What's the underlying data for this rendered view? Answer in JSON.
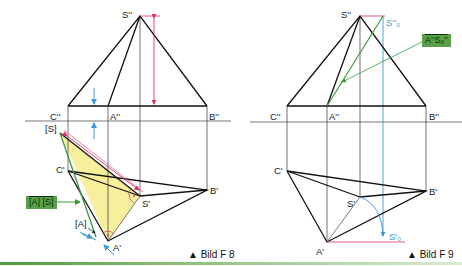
{
  "figures": [
    {
      "caption": "▲ Bild F 8",
      "labels": {
        "S2": "S''",
        "C2": "C''",
        "A2": "A''",
        "B2": "B''",
        "S_bracket": "[S]",
        "C1": "C'",
        "S1": "S'",
        "B1": "B'",
        "A1": "A'",
        "A_bracket": "[A]"
      },
      "callout": "[A] [S]"
    },
    {
      "caption": "▲ Bild F 9",
      "labels": {
        "S2": "S''",
        "S2_0": "S''₀",
        "C2": "C''",
        "A2": "A''",
        "B2": "B''",
        "C1": "C'",
        "S1": "S'",
        "B1": "B'",
        "A1": "A'",
        "S1_0": "S'₀"
      },
      "callout": "A''S₀''"
    }
  ],
  "colors": {
    "line": "#111111",
    "red": "#d6336c",
    "blue": "#3a9ad4",
    "green": "#3c9a3a",
    "fill_yellow": "#f8ef9c",
    "callout_bg": "#5aa048"
  }
}
